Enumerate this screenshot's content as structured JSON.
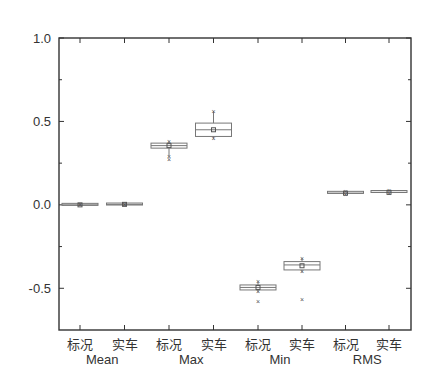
{
  "chart_data": {
    "type": "box",
    "title": "",
    "xlabel": "",
    "ylabel": "",
    "ylim": [
      -0.75,
      1.0
    ],
    "yticks": [
      1.0,
      0.5,
      0.0,
      -0.5
    ],
    "ytick_labels": [
      "1.0",
      "0.5",
      "0.0",
      "-0.5"
    ],
    "grid": false,
    "legend": null,
    "groups": [
      {
        "name": "Mean",
        "categories": [
          "标况",
          "实车"
        ]
      },
      {
        "name": "Max",
        "categories": [
          "标况",
          "实车"
        ]
      },
      {
        "name": "Min",
        "categories": [
          "标况",
          "实车"
        ]
      },
      {
        "name": "RMS",
        "categories": [
          "标况",
          "实车"
        ]
      }
    ],
    "categories": [
      "标况",
      "实车",
      "标况",
      "实车",
      "标况",
      "实车",
      "标况",
      "实车"
    ],
    "boxes": [
      {
        "group": "Mean",
        "label": "标况",
        "whisker_low": 0.0,
        "q1": -0.003,
        "median": 0.0,
        "q3": 0.003,
        "whisker_high": 0.0,
        "mean": 0.0,
        "outliers": []
      },
      {
        "group": "Mean",
        "label": "实车",
        "whisker_low": 0.0,
        "q1": -0.002,
        "median": 0.003,
        "q3": 0.005,
        "whisker_high": 0.0,
        "mean": 0.003,
        "outliers": []
      },
      {
        "group": "Max",
        "label": "标况",
        "whisker_low": 0.29,
        "q1": 0.34,
        "median": 0.355,
        "q3": 0.37,
        "whisker_high": 0.38,
        "mean": 0.355,
        "outliers": [
          0.27
        ]
      },
      {
        "group": "Max",
        "label": "实车",
        "whisker_low": 0.4,
        "q1": 0.41,
        "median": 0.45,
        "q3": 0.49,
        "whisker_high": 0.56,
        "mean": 0.45,
        "outliers": []
      },
      {
        "group": "Min",
        "label": "标况",
        "whisker_low": -0.52,
        "q1": -0.51,
        "median": -0.495,
        "q3": -0.48,
        "whisker_high": -0.46,
        "mean": -0.495,
        "outliers": [
          -0.58
        ]
      },
      {
        "group": "Min",
        "label": "实车",
        "whisker_low": -0.4,
        "q1": -0.39,
        "median": -0.36,
        "q3": -0.34,
        "whisker_high": -0.32,
        "mean": -0.365,
        "outliers": [
          -0.57
        ]
      },
      {
        "group": "RMS",
        "label": "标况",
        "whisker_low": 0.065,
        "q1": 0.065,
        "median": 0.07,
        "q3": 0.075,
        "whisker_high": 0.08,
        "mean": 0.07,
        "outliers": []
      },
      {
        "group": "RMS",
        "label": "实车",
        "whisker_low": 0.07,
        "q1": 0.07,
        "median": 0.075,
        "q3": 0.08,
        "whisker_high": 0.085,
        "mean": 0.075,
        "outliers": []
      }
    ]
  },
  "colors": {
    "axis": "#333333",
    "box_stroke": "#777777",
    "box_fill": "#ffffff",
    "marker": "#555555"
  }
}
